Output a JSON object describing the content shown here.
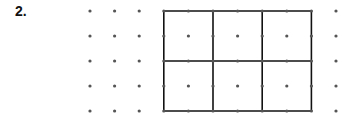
{
  "problem_label": "2.",
  "dot_grid": {
    "columns": 11,
    "rows": 5
  },
  "rectangle": {
    "from_col": 3,
    "to_col": 9,
    "from_row": 0,
    "to_row": 4,
    "vertical_line_cols": [
      3,
      5,
      7,
      9
    ],
    "horizontal_line_rows": [
      0,
      2,
      4
    ]
  },
  "colors": {
    "dot": "#555555",
    "line": "#111111"
  }
}
